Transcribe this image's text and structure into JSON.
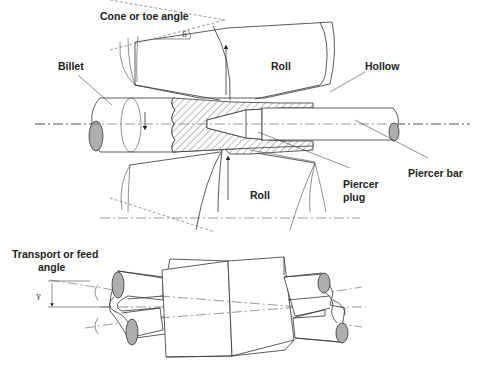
{
  "diagram": {
    "top_view": {
      "labels": {
        "cone_angle": "Cone or toe angle",
        "cone_angle_symbol": "δ",
        "billet": "Billet",
        "roll_upper": "Roll",
        "hollow": "Hollow",
        "piercer_bar": "Piercer bar",
        "roll_lower": "Roll",
        "piercer_plug_line1": "Piercer",
        "piercer_plug_line2": "plug"
      }
    },
    "side_view": {
      "labels": {
        "feed_angle_line1": "Transport or feed",
        "feed_angle_line2": "angle",
        "feed_angle_symbol": "γ"
      }
    },
    "colors": {
      "line": "#333333",
      "background": "#ffffff",
      "hatch": "#555555"
    }
  }
}
